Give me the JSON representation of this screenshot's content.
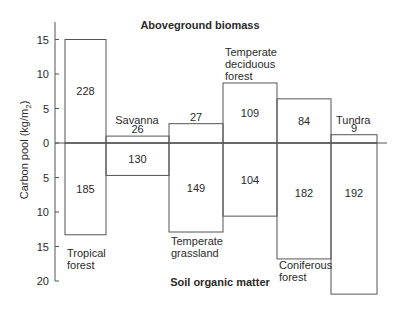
{
  "chart_data": {
    "type": "bar",
    "subtype": "diverging-stacked",
    "title_top": "Aboveground biomass",
    "title_bottom": "Soil organic matter",
    "ylabel": "Carbon pool (kg/m₂)",
    "ylabel_main": "Carbon pool (kg/m",
    "ylabel_sub": "2",
    "ylabel_close": ")",
    "ylim": [
      -20,
      16
    ],
    "y_ticks": [
      15,
      10,
      5,
      0,
      5,
      10,
      15,
      20
    ],
    "y_tick_values": [
      15,
      10,
      5,
      0,
      -5,
      -10,
      -15,
      -20
    ],
    "grid": false,
    "categories": [
      "Tropical forest",
      "Savanna",
      "Temperate grassland",
      "Temperate deciduous forest",
      "Coniferous forest",
      "Tundra"
    ],
    "series": [
      {
        "name": "Aboveground biomass",
        "values": [
          15.0,
          1.0,
          2.8,
          8.7,
          6.4,
          1.2
        ],
        "labels": [
          "228",
          "26",
          "27",
          "109",
          "84",
          "9"
        ]
      },
      {
        "name": "Soil organic matter",
        "values": [
          13.3,
          4.7,
          12.9,
          10.6,
          16.8,
          21.9
        ],
        "labels": [
          "185",
          "130",
          "149",
          "104",
          "182",
          "192"
        ]
      }
    ],
    "bar_widths_relative": [
      41,
      63,
      54,
      54,
      54,
      46
    ],
    "category_label_lines": [
      [
        "Tropical",
        "forest"
      ],
      [
        "Savanna"
      ],
      [
        "Temperate",
        "grassland"
      ],
      [
        "Temperate",
        "deciduous",
        "forest"
      ],
      [
        "Coniferous",
        "forest"
      ],
      [
        "Tundra"
      ]
    ],
    "colors": {
      "line": "#555555",
      "text": "#2a2a2a",
      "background": "#ffffff"
    }
  }
}
